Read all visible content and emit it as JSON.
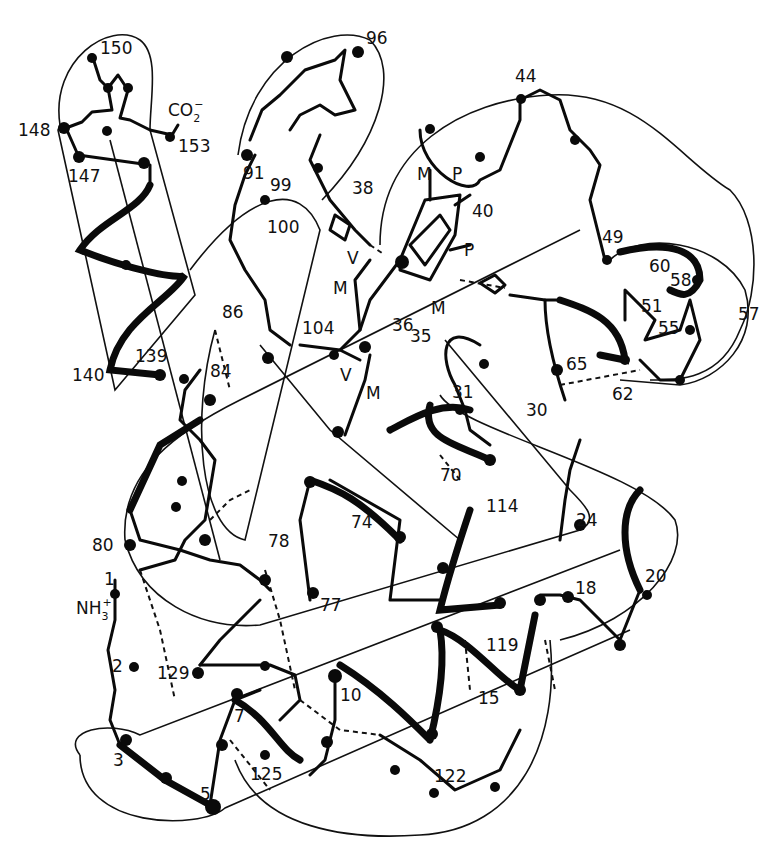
{
  "diagram": {
    "type": "protein backbone chain trace (myoglobin-like, heme group)",
    "stroke_color": "#0a0a0a",
    "background": "#ffffff"
  },
  "labels": {
    "terminus_c": "CO",
    "terminus_c_sub": "2",
    "terminus_c_sup": "−",
    "terminus_n": "NH",
    "terminus_n_sub": "3",
    "terminus_n_sup": "+",
    "heme": {
      "M": "M",
      "P": "P",
      "V": "V"
    },
    "residues": [
      {
        "id": "r150",
        "text": "150",
        "x": 100,
        "y": 40
      },
      {
        "id": "r148",
        "text": "148",
        "x": 18,
        "y": 122
      },
      {
        "id": "r153",
        "text": "153",
        "x": 178,
        "y": 138
      },
      {
        "id": "r147",
        "text": "147",
        "x": 68,
        "y": 168
      },
      {
        "id": "r96",
        "text": "96",
        "x": 366,
        "y": 30
      },
      {
        "id": "r44",
        "text": "44",
        "x": 515,
        "y": 68
      },
      {
        "id": "r91",
        "text": "91",
        "x": 243,
        "y": 165
      },
      {
        "id": "r99",
        "text": "99",
        "x": 270,
        "y": 177
      },
      {
        "id": "r38",
        "text": "38",
        "x": 352,
        "y": 180
      },
      {
        "id": "r40",
        "text": "40",
        "x": 472,
        "y": 203
      },
      {
        "id": "r100",
        "text": "100",
        "x": 267,
        "y": 219
      },
      {
        "id": "r49",
        "text": "49",
        "x": 602,
        "y": 229
      },
      {
        "id": "r60",
        "text": "60",
        "x": 649,
        "y": 258
      },
      {
        "id": "r58",
        "text": "58",
        "x": 670,
        "y": 272
      },
      {
        "id": "r86",
        "text": "86",
        "x": 222,
        "y": 304
      },
      {
        "id": "r104",
        "text": "104",
        "x": 302,
        "y": 320
      },
      {
        "id": "r36",
        "text": "36",
        "x": 392,
        "y": 317
      },
      {
        "id": "r51",
        "text": "51",
        "x": 641,
        "y": 298
      },
      {
        "id": "r55",
        "text": "55",
        "x": 658,
        "y": 320
      },
      {
        "id": "r57",
        "text": "57",
        "x": 738,
        "y": 306
      },
      {
        "id": "r35",
        "text": "35",
        "x": 410,
        "y": 328
      },
      {
        "id": "r139",
        "text": "139",
        "x": 135,
        "y": 348
      },
      {
        "id": "r84",
        "text": "84",
        "x": 210,
        "y": 363
      },
      {
        "id": "r65",
        "text": "65",
        "x": 566,
        "y": 356
      },
      {
        "id": "r140",
        "text": "140",
        "x": 72,
        "y": 367
      },
      {
        "id": "r62",
        "text": "62",
        "x": 612,
        "y": 386
      },
      {
        "id": "r31",
        "text": "31",
        "x": 452,
        "y": 384
      },
      {
        "id": "r30",
        "text": "30",
        "x": 526,
        "y": 402
      },
      {
        "id": "r70",
        "text": "70",
        "x": 440,
        "y": 467
      },
      {
        "id": "r74",
        "text": "74",
        "x": 351,
        "y": 514
      },
      {
        "id": "r114",
        "text": "114",
        "x": 486,
        "y": 498
      },
      {
        "id": "r24",
        "text": "24",
        "x": 576,
        "y": 512
      },
      {
        "id": "r78",
        "text": "78",
        "x": 268,
        "y": 533
      },
      {
        "id": "r80",
        "text": "80",
        "x": 92,
        "y": 537
      },
      {
        "id": "r1",
        "text": "1",
        "x": 104,
        "y": 571
      },
      {
        "id": "r18",
        "text": "18",
        "x": 575,
        "y": 580
      },
      {
        "id": "r20",
        "text": "20",
        "x": 645,
        "y": 568
      },
      {
        "id": "r77",
        "text": "77",
        "x": 320,
        "y": 597
      },
      {
        "id": "r119",
        "text": "119",
        "x": 486,
        "y": 637
      },
      {
        "id": "r2",
        "text": "2",
        "x": 112,
        "y": 658
      },
      {
        "id": "r129",
        "text": "129",
        "x": 157,
        "y": 665
      },
      {
        "id": "r10",
        "text": "10",
        "x": 340,
        "y": 687
      },
      {
        "id": "r15",
        "text": "15",
        "x": 478,
        "y": 690
      },
      {
        "id": "r7",
        "text": "7",
        "x": 234,
        "y": 708
      },
      {
        "id": "r3",
        "text": "3",
        "x": 113,
        "y": 752
      },
      {
        "id": "r122",
        "text": "122",
        "x": 434,
        "y": 768
      },
      {
        "id": "r125",
        "text": "125",
        "x": 250,
        "y": 766
      },
      {
        "id": "r5",
        "text": "5",
        "x": 200,
        "y": 786
      }
    ]
  }
}
